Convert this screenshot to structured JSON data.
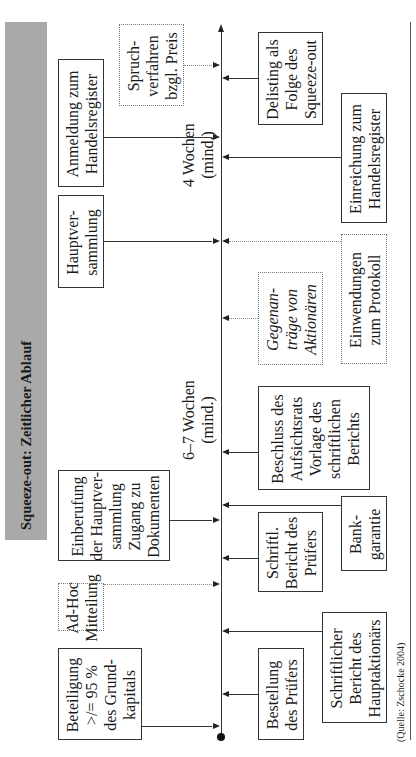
{
  "title": "Squeeze-out: Zeitlicher Ablauf",
  "source": "(Quelle: Zschocke 2004)",
  "timeline": {
    "orientation": "rotated -90deg (time runs bottom to top)",
    "durations": [
      {
        "id": "d1",
        "label": "6–7 Wochen\n(mind.)"
      },
      {
        "id": "d2",
        "label": "4 Wochen\n(mind.)"
      }
    ]
  },
  "events_above": [
    {
      "id": "beteiligung",
      "label": "Beteiligung\n>/= 95 %\ndes Grund-\nkapitals",
      "style": "solid"
    },
    {
      "id": "adhoc",
      "label": "Ad-Hoc\nMitteilung",
      "style": "dotted"
    },
    {
      "id": "einberufung",
      "label": "Einberufung\nder Hauptver-\nsammlung\nZugang zu\nDokumenten",
      "style": "solid"
    },
    {
      "id": "hauptversammlung",
      "label": "Hauptver-\nsammlung",
      "style": "solid"
    },
    {
      "id": "anmeldung",
      "label": "Anmeldung zum\nHandelsregister",
      "style": "solid"
    },
    {
      "id": "spruchverfahren",
      "label": "Spruch-\nverfahren\nbzgl. Preis",
      "style": "dotted"
    }
  ],
  "events_below": [
    {
      "id": "bestellung",
      "label": "Bestellung\ndes Prüfers",
      "style": "solid"
    },
    {
      "id": "bericht_hauptaktionaer",
      "label": "Schriftlicher\nBericht des\nHauptaktionärs",
      "style": "solid"
    },
    {
      "id": "bericht_pruefer",
      "label": "Schriftl.\nBericht des\nPrüfers",
      "style": "solid"
    },
    {
      "id": "bankgarantie",
      "label": "Bank-\ngarantie",
      "style": "solid"
    },
    {
      "id": "beschluss",
      "label": "Beschluss des\nAufsichtsrats\nVorlage des\nschriftlichen\nBerichts",
      "style": "solid"
    },
    {
      "id": "gegenantraege",
      "label": "Gegenan-\nträge von\nAktionären",
      "style": "dotted-italic"
    },
    {
      "id": "einwendungen",
      "label": "Einwendungen\nzum Protokoll",
      "style": "dotted"
    },
    {
      "id": "einreichung",
      "label": "Einreichung zum\nHandelsregister",
      "style": "solid"
    },
    {
      "id": "delisting",
      "label": "Delisting als\nFolge des\nSqueeze-out",
      "style": "solid"
    }
  ]
}
